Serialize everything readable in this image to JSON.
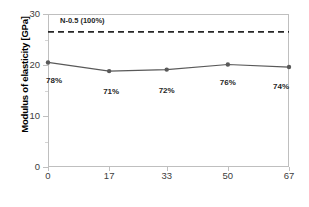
{
  "chart_data": {
    "type": "line",
    "title": "",
    "xlabel": "Brick and tile contents [%]",
    "ylabel": "Modulus of elasticity [GPa]",
    "x": [
      0,
      17,
      33,
      50,
      67
    ],
    "xtick_labels": [
      "0",
      "17",
      "33",
      "50",
      "67"
    ],
    "ytick_labels": [
      "0",
      "10",
      "20",
      "30"
    ],
    "yticks": [
      0,
      10,
      20,
      30
    ],
    "xlim": [
      0,
      67
    ],
    "ylim": [
      0,
      30
    ],
    "grid": false,
    "legend": "none",
    "series": [
      {
        "name": "Modulus of elasticity",
        "values": [
          20.5,
          18.8,
          19.1,
          20.1,
          19.6
        ],
        "point_labels": [
          "78%",
          "71%",
          "72%",
          "76%",
          "74%"
        ],
        "color": "#595959",
        "marker": "circle",
        "linestyle": "solid"
      }
    ],
    "reference_lines": [
      {
        "label": "N-0.5 (100%)",
        "value": 26.5,
        "linestyle": "dashed",
        "color": "#262626"
      }
    ],
    "colors": {
      "series": "#595959",
      "reference": "#262626",
      "axis": "#bfbfbf",
      "tick_text": "#404040",
      "background": "#ffffff"
    }
  }
}
